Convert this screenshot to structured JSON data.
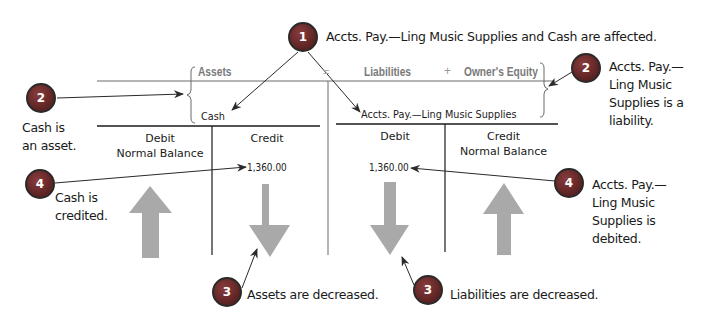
{
  "equation": {
    "assets": "Assets",
    "equals": "=",
    "liabilities": "Liabilities",
    "plus": "+",
    "equity": "Owner's Equity"
  },
  "accounts": {
    "left": {
      "name": "Cash",
      "debit_header": "Debit",
      "debit_sub": "Normal Balance",
      "credit_header": "Credit",
      "credit_amount": "1,360.00",
      "debit_arrow": "up",
      "credit_arrow": "down"
    },
    "right": {
      "name": "Accts. Pay.—Ling Music Supplies",
      "debit_header": "Debit",
      "debit_amount": "1,360.00",
      "credit_header": "Credit",
      "credit_sub": "Normal Balance",
      "debit_arrow": "down",
      "credit_arrow": "up"
    }
  },
  "callouts": [
    {
      "number": "1",
      "text": "Accts. Pay.—Ling Music Supplies and Cash are affected."
    },
    {
      "number": "2",
      "text": [
        "Cash is",
        "an asset."
      ]
    },
    {
      "number": "2",
      "text": [
        "Accts. Pay.—",
        "Ling Music",
        "Supplies is a",
        "liability."
      ]
    },
    {
      "number": "3",
      "text": "Assets are decreased."
    },
    {
      "number": "3",
      "text": "Liabilities are decreased."
    },
    {
      "number": "4",
      "text": [
        "Cash is",
        "credited."
      ]
    },
    {
      "number": "4",
      "text": [
        "Accts. Pay.—",
        "Ling Music",
        "Supplies is",
        "debited."
      ]
    }
  ],
  "colors": {
    "badge": "#6b2c2c",
    "arrow_fill": "#a9a9a9",
    "header_gray": "#7a7a7a"
  }
}
